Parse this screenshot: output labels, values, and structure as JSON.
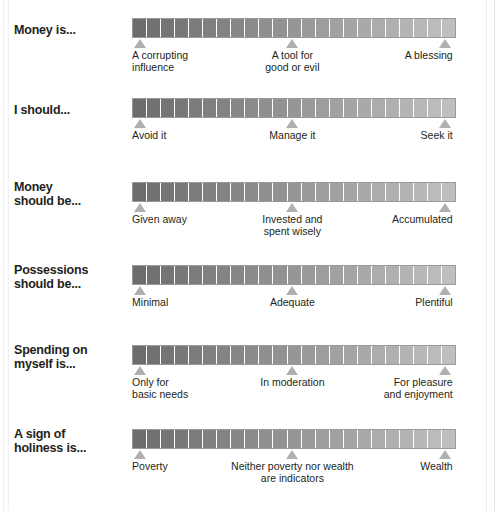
{
  "figure": {
    "background_color": "#ffffff",
    "bar": {
      "segment_count": 23,
      "gradient_start_color": "#6d6d6d",
      "gradient_end_color": "#bfbfbf",
      "border_color": "#9a9a9a",
      "gap_color": "#ffffff"
    },
    "marker_color": "#b0b0b0",
    "text_color": "#231f20"
  },
  "chart_data": {
    "type": "bar",
    "title": "",
    "xlabel": "",
    "ylabel": "",
    "grid": false,
    "legend": "none",
    "scale_positions_pct": [
      2.5,
      49.5,
      96.5
    ],
    "categories": [
      "Money is...",
      "I should...",
      "Money should be...",
      "Possessions should be...",
      "Spending on myself is...",
      "A sign of holiness is..."
    ],
    "series": [
      {
        "name": "left anchor",
        "values": [
          "A corrupting influence",
          "Avoid it",
          "Given away",
          "Minimal",
          "Only for basic needs",
          "Poverty"
        ]
      },
      {
        "name": "middle anchor",
        "values": [
          "A tool for good or evil",
          "Manage it",
          "Invested and spent wisely",
          "Adequate",
          "In moderation",
          "Neither poverty nor wealth are indicators"
        ]
      },
      {
        "name": "right anchor",
        "values": [
          "A blessing",
          "Seek it",
          "Accumulated",
          "Plentiful",
          "For pleasure and enjoyment",
          "Wealth"
        ]
      }
    ]
  },
  "rows": [
    {
      "prompt": "Money is...",
      "prompt_lines": 1,
      "anchors": [
        "A corrupting\ninfluence",
        "A tool for\ngood or evil",
        "A blessing"
      ]
    },
    {
      "prompt": "I should...",
      "prompt_lines": 1,
      "anchors": [
        "Avoid it",
        "Manage it",
        "Seek it"
      ]
    },
    {
      "prompt": "Money\nshould be...",
      "prompt_lines": 2,
      "anchors": [
        "Given away",
        "Invested and\nspent wisely",
        "Accumulated"
      ]
    },
    {
      "prompt": "Possessions\nshould be...",
      "prompt_lines": 2,
      "anchors": [
        "Minimal",
        "Adequate",
        "Plentiful"
      ]
    },
    {
      "prompt": "Spending on\nmyself is...",
      "prompt_lines": 2,
      "anchors": [
        "Only for\nbasic needs",
        "In moderation",
        "For pleasure\nand enjoyment"
      ]
    },
    {
      "prompt": "A sign of\nholiness is...",
      "prompt_lines": 2,
      "anchors": [
        "Poverty",
        "Neither poverty nor wealth\nare indicators",
        "Wealth"
      ]
    }
  ]
}
